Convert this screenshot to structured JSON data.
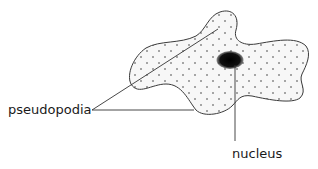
{
  "diagram": {
    "labels": {
      "pseudopodia": "pseudopodia",
      "nucleus": "nucleus"
    },
    "colors": {
      "outline": "#3a3a3a",
      "cytoplasm_fill": "#f7f7f7",
      "granules": "#8a8a8a",
      "nucleus": "#111111",
      "leader_lines": "#333333",
      "text": "#1a1a1a"
    }
  }
}
